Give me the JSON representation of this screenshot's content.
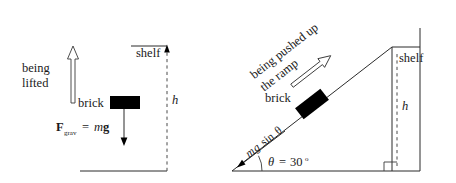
{
  "figure": {
    "background_color": "#ffffff",
    "ink_color": "#1a1a1a"
  },
  "left_panel": {
    "name": "vertical-lift-scenario",
    "motion_label_line1": "being",
    "motion_label_line2": "lifted",
    "brick_label": "brick",
    "shelf_label": "shelf",
    "height_label": "h",
    "force_label": {
      "symbol": "F",
      "subscript": "grav",
      "equals": "=",
      "mass": "m",
      "gravity": "g"
    }
  },
  "right_panel": {
    "name": "ramp-push-scenario",
    "motion_label_line1": "being pushed up",
    "motion_label_line2": "the ramp",
    "brick_label": "brick",
    "shelf_label": "shelf",
    "height_label": "h",
    "force_label": {
      "mass": "m",
      "gravity": "g",
      "sin": "sin",
      "theta": "θ"
    },
    "angle_label": {
      "theta": "θ",
      "equals": "=",
      "value": "30",
      "degree": "o"
    }
  }
}
